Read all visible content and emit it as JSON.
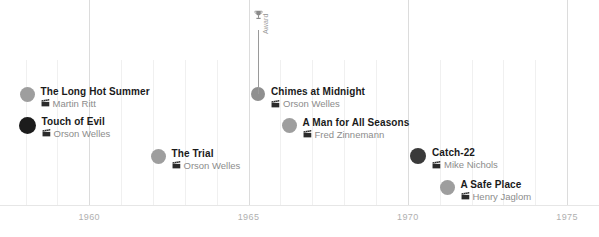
{
  "chart_data": {
    "type": "scatter",
    "title": "",
    "xlabel": "",
    "ylabel": "",
    "xlim": [
      1957.2,
      1976.0
    ],
    "grid": true,
    "legend": false,
    "tick_labels": [
      "1960",
      "1965",
      "1970",
      "1975"
    ],
    "tick_values": [
      1960,
      1965,
      1970,
      1975
    ],
    "gridline_years": [
      1958,
      1959,
      1960,
      1961,
      1962,
      1963,
      1964,
      1965,
      1966,
      1967,
      1968,
      1969,
      1970,
      1971,
      1972,
      1973,
      1974,
      1975
    ],
    "events": [
      {
        "title": "The Long Hot Summer",
        "director": "Martin Ritt",
        "year": 1958,
        "x": 27,
        "y": 94,
        "dot_color": "#9e9e9e",
        "dot_size": 15
      },
      {
        "title": "Touch of Evil",
        "director": "Orson Welles",
        "year": 1958,
        "x": 27,
        "y": 125,
        "dot_color": "#1c1c1c",
        "dot_size": 17
      },
      {
        "title": "The Trial",
        "director": "Orson Welles",
        "year": 1962,
        "x": 158,
        "y": 156,
        "dot_color": "#9e9e9e",
        "dot_size": 15
      },
      {
        "title": "Chimes at Midnight",
        "director": "Orson Welles",
        "year": 1965,
        "x": 258,
        "y": 94,
        "dot_color": "#8f8f8f",
        "dot_size": 14
      },
      {
        "title": "A Man for All Seasons",
        "director": "Fred Zinnemann",
        "year": 1966,
        "x": 289,
        "y": 125,
        "dot_color": "#9e9e9e",
        "dot_size": 15
      },
      {
        "title": "Catch-22",
        "director": "Mike Nichols",
        "year": 1970,
        "x": 418,
        "y": 156,
        "dot_color": "#3a3a3a",
        "dot_size": 16
      },
      {
        "title": "A Safe Place",
        "director": "Henry Jaglom",
        "year": 1971,
        "x": 447,
        "y": 187,
        "dot_color": "#9e9e9e",
        "dot_size": 15
      }
    ],
    "annotation": {
      "label": "Award",
      "icon": "trophy-icon",
      "attached_to": "Chimes at Midnight",
      "x": 258,
      "stem_top": 30,
      "stem_bottom": 94
    }
  },
  "colors": {
    "gridline": "#f0f0f0",
    "gridline_major": "#dcdcdc",
    "tick_text": "#b0b0b0",
    "title_text": "#1a1a1a",
    "sub_text": "#8c8c8c",
    "stem": "#9a9a9a"
  }
}
